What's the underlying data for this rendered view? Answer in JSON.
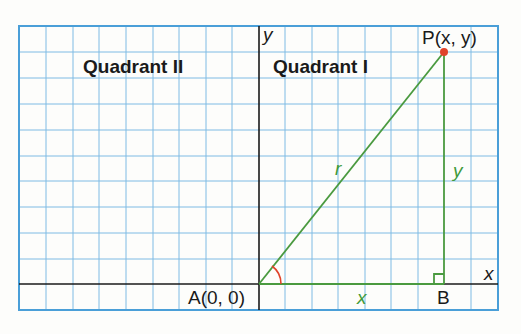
{
  "diagram": {
    "quadrants": {
      "q2": "Quadrant II",
      "q1": "Quadrant I"
    },
    "axes": {
      "x": "x",
      "y": "y"
    },
    "points": {
      "P": {
        "label": "P(x, y)"
      },
      "A": {
        "label": "A(0, 0)"
      },
      "B": {
        "label": "B"
      }
    },
    "segments": {
      "hypotenuse": "r",
      "base": "x",
      "height": "y"
    },
    "colors": {
      "grid": "#5aa8dc",
      "axis": "#1a1a1a",
      "triangle": "#4a9a3f",
      "point": "#e0432a",
      "angle": "#e0432a"
    }
  }
}
